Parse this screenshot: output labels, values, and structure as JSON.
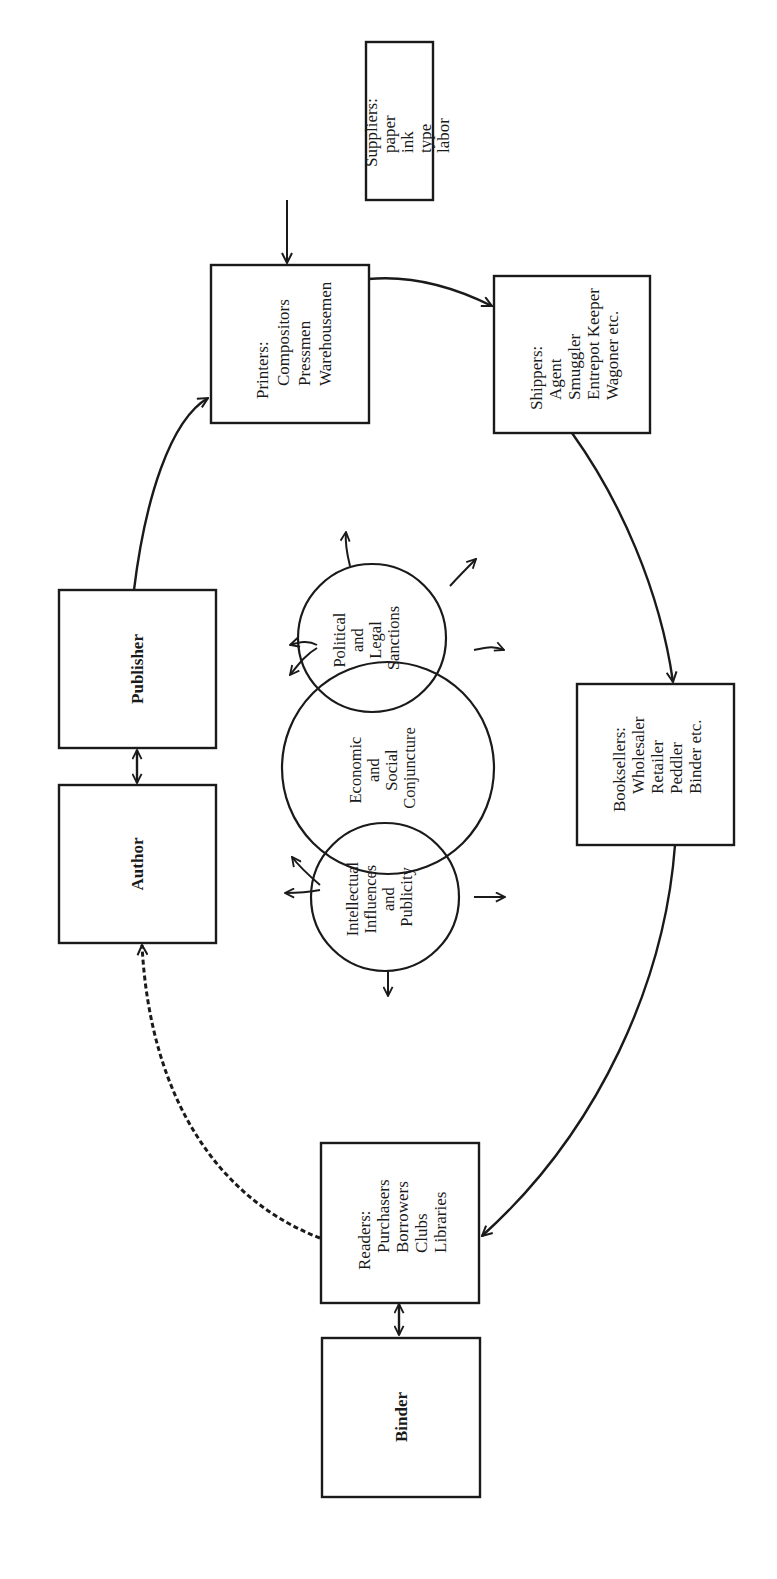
{
  "diagram": {
    "orientation": "rotated 90deg counter-clockwise",
    "nodes": {
      "suppliers": {
        "heading": "Suppliers:",
        "items": [
          "paper",
          "ink",
          "type",
          "labor"
        ]
      },
      "printers": {
        "heading": "Printers:",
        "items": [
          "Compositors",
          "Pressmen",
          "Warehousemen"
        ]
      },
      "shippers": {
        "heading": "Shippers:",
        "items": [
          "Agent",
          "Smuggler",
          "Entrepot Keeper",
          "Wagoner etc."
        ]
      },
      "publisher": {
        "heading": "Publisher"
      },
      "author": {
        "heading": "Author"
      },
      "booksellers": {
        "heading": "Booksellers:",
        "items": [
          "Wholesaler",
          "Retailer",
          "Peddler",
          "Binder etc."
        ]
      },
      "readers": {
        "heading": "Readers:",
        "items": [
          "Purchasers",
          "Borrowers",
          "Clubs",
          "Libraries"
        ]
      },
      "binder": {
        "heading": "Binder"
      }
    },
    "circles": {
      "political": {
        "lines": [
          "Political",
          "and",
          "Legal",
          "Sanctions"
        ]
      },
      "economic": {
        "lines": [
          "Economic",
          "and",
          "Social",
          "Conjuncture"
        ]
      },
      "intellectual": {
        "lines": [
          "Intellectual",
          "Influences",
          "and",
          "Publicity"
        ]
      }
    },
    "edges": [
      {
        "from": "Suppliers",
        "to": "Printers",
        "style": "solid"
      },
      {
        "from": "Publisher",
        "to": "Printers",
        "style": "solid"
      },
      {
        "from": "Printers",
        "to": "Shippers",
        "style": "solid"
      },
      {
        "from": "Shippers",
        "to": "Booksellers",
        "style": "solid"
      },
      {
        "from": "Booksellers",
        "to": "Readers",
        "style": "solid"
      },
      {
        "from": "Readers",
        "to": "Author",
        "style": "dashed"
      },
      {
        "from": "Author",
        "to": "Publisher",
        "style": "bidirectional"
      },
      {
        "from": "Readers",
        "to": "Binder",
        "style": "bidirectional"
      }
    ]
  }
}
